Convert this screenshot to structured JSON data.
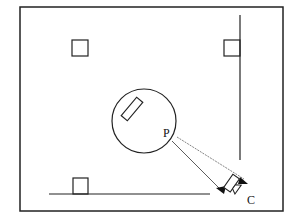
{
  "diagram": {
    "labels": {
      "point": "P",
      "camera": "C"
    },
    "colors": {
      "stroke": "#222222",
      "background": "#ffffff"
    }
  }
}
